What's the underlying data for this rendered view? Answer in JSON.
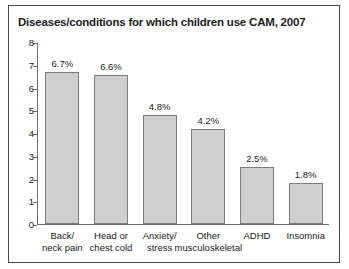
{
  "figure": {
    "title": "Diseases/conditions for which children use CAM, 2007",
    "border_color": "#4a4a4a",
    "background": "#ffffff"
  },
  "chart_data": {
    "type": "bar",
    "title": "Diseases/conditions for which children use CAM, 2007",
    "xlabel": "",
    "ylabel": "",
    "ylim": [
      0,
      8
    ],
    "yticks": [
      "0",
      "1",
      "2",
      "3",
      "4",
      "5",
      "6",
      "7",
      "8"
    ],
    "grid": false,
    "legend": null,
    "bar_color": "#cfcfcf",
    "bar_edge_color": "#7d7d7d",
    "categories": [
      "Back/ neck pain",
      "Head or chest cold",
      "Anxiety/ stress",
      "Other musculoskeletal",
      "ADHD",
      "Insomnia"
    ],
    "category_lines": [
      [
        "Back/",
        "neck pain"
      ],
      [
        "Head or",
        "chest cold"
      ],
      [
        "Anxiety/",
        "stress"
      ],
      [
        "Other",
        "musculoskeletal"
      ],
      [
        "ADHD",
        ""
      ],
      [
        "Insomnia",
        ""
      ]
    ],
    "values": [
      6.7,
      6.6,
      4.8,
      4.2,
      2.5,
      1.8
    ],
    "data_labels": [
      "6.7%",
      "6.6%",
      "4.8%",
      "4.2%",
      "2.5%",
      "1.8%"
    ]
  }
}
